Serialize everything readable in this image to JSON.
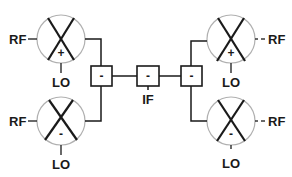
{
  "diagram": {
    "type": "image-reject mixer block diagram",
    "mixers": [
      {
        "id": "top-left",
        "sign": "+",
        "rf_label": "RF",
        "lo_label": "LO",
        "rf_side": "left",
        "rf_style": "solid"
      },
      {
        "id": "bottom-left",
        "sign": "-",
        "rf_label": "RF",
        "lo_label": "LO",
        "rf_side": "left",
        "rf_style": "solid"
      },
      {
        "id": "top-right",
        "sign": "+",
        "rf_label": "RF",
        "lo_label": "LO",
        "rf_side": "right",
        "rf_style": "dashed"
      },
      {
        "id": "bottom-right",
        "sign": "-",
        "rf_label": "RF",
        "lo_label": "LO",
        "rf_side": "right",
        "rf_style": "dashed"
      }
    ],
    "blocks": [
      {
        "id": "left-combiner",
        "sign": "-"
      },
      {
        "id": "center-combiner",
        "sign": "-"
      },
      {
        "id": "right-combiner",
        "sign": "-"
      }
    ],
    "if_label": "IF",
    "colors": {
      "line": "#1a1a1a",
      "circle": "#b0b0b0",
      "background": "#ffffff"
    }
  }
}
